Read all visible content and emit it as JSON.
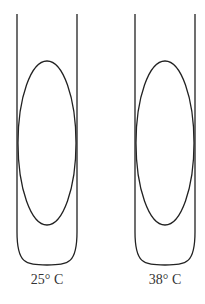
{
  "diagram": {
    "type": "test-tube-comparison",
    "stroke_color": "#222222",
    "tubes": [
      {
        "id": "tube-25",
        "label": "25° C",
        "tube_left_x": 17,
        "tube_right_x": 77,
        "tube_top_y": 14,
        "tube_curve_start_y": 232,
        "tube_bottom_y": 265,
        "ellipse": {
          "cx": 47,
          "cy": 143,
          "rx": 29,
          "ry": 82
        }
      },
      {
        "id": "tube-38",
        "label": "38° C",
        "tube_left_x": 135,
        "tube_right_x": 195,
        "tube_top_y": 14,
        "tube_curve_start_y": 232,
        "tube_bottom_y": 265,
        "ellipse": {
          "cx": 165,
          "cy": 143,
          "rx": 29,
          "ry": 82
        }
      }
    ]
  }
}
